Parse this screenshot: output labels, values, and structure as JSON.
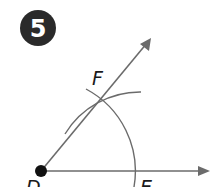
{
  "step": {
    "number": "5",
    "badge_color": "#2a2a2a"
  },
  "points": {
    "D": {
      "label": "D",
      "x": 41,
      "y": 171
    },
    "E": {
      "label": "E",
      "x": 134,
      "y": 171
    },
    "F": {
      "label": "F",
      "x": 101,
      "y": 98
    }
  },
  "rays": [
    {
      "name": "ray-DE",
      "from": "D",
      "tip": [
        210,
        171
      ]
    },
    {
      "name": "ray-DF",
      "from": "D",
      "tip": [
        151,
        38
      ]
    }
  ],
  "colors": {
    "line": "#6b6b6b",
    "point": "#111111"
  }
}
